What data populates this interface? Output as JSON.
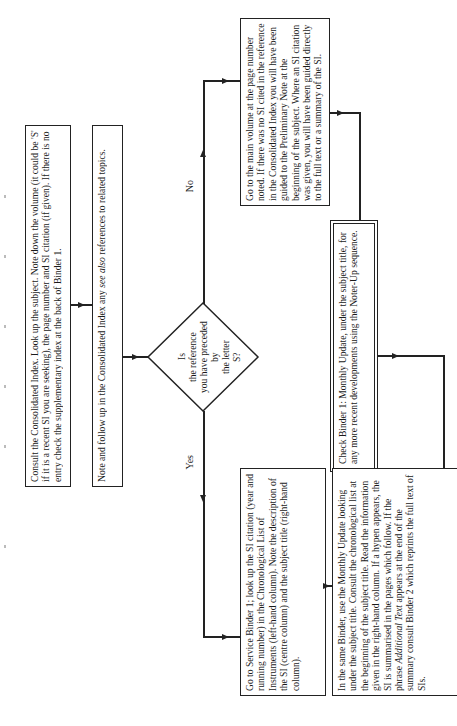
{
  "flowchart": {
    "consult_box": "Consult the Consolidated Index. Look up the subject. Note down the volume (it could be 'S' if it is a recent SI you are seeking), the page number and SI citation (if given). If there is no entry check the supplementary index at the back of Binder 1.",
    "follow_box": {
      "before": "Note and follow up in the Consolidated Index any ",
      "italic": "see also",
      "after": " references to related topics."
    },
    "decision": {
      "line1": "Is",
      "line2": "the reference",
      "line3": "you have preceded by",
      "line4": "the letter",
      "line5": "S?"
    },
    "no_label": "No",
    "yes_label": "Yes",
    "main_volume_box": "Go to the main volume at the page number noted. If there was no SI cited in the reference in the Consolidated Index you will have been guided to the Preliminary Note at the beginning of the subject. Where an SI citation was given, you will have been guided directly to the full text or a summary of the SI.",
    "check_binder_box": "Check Binder 1: Monthly Update, under the subject title, for any more recent developments using the Noter-Up sequence.",
    "service_binder_box": "Go to Service Binder 1; look up the SI citation (year and running number) in the Chronological List of Instruments (left-hand column). Note the description of the SI (centre column) and the subject title (right-hand column).",
    "same_binder_box": {
      "before": "In the same Binder, use the Monthly Update looking under the subject title. Consult the chronological list at the beginning of the subject title. Read the information given in the right-hand column. If a hypen appears, the SI is summarised in the pages which follow. If the phrase ",
      "italic": "Additional Text",
      "after": " appears at the end of the summary consult Binder 2 which reprints the full text of SIs."
    }
  },
  "colors": {
    "ink": "#222222",
    "background": "#ffffff"
  }
}
